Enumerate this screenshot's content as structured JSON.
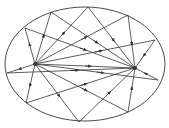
{
  "diagram": {
    "stroke_color": "#333333",
    "ellipse": {
      "cx": 85,
      "cy": 64,
      "rx": 80,
      "ry": 57
    },
    "foci": [
      {
        "name": "left-focus",
        "x": 35,
        "y": 64
      },
      {
        "name": "right-focus",
        "x": 135,
        "y": 68
      }
    ],
    "reflection_points": [
      {
        "x": 25,
        "y": 28
      },
      {
        "x": 51,
        "y": 12
      },
      {
        "x": 88,
        "y": 7
      },
      {
        "x": 128,
        "y": 15
      },
      {
        "x": 155,
        "y": 40
      },
      {
        "x": 158,
        "y": 80
      },
      {
        "x": 128,
        "y": 112
      },
      {
        "x": 79,
        "y": 122
      },
      {
        "x": 26,
        "y": 103
      },
      {
        "x": 7,
        "y": 73
      }
    ]
  }
}
